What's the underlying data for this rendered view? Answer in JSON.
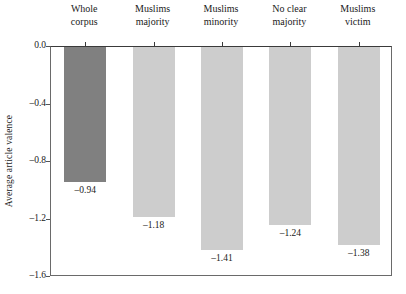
{
  "chart_data": {
    "type": "bar",
    "title": "",
    "subtitle": "",
    "xlabel": "",
    "ylabel": "Average article valence",
    "orientation": "vertical-negative",
    "categories": [
      "Whole corpus",
      "Muslims majority",
      "Muslims minority",
      "No clear majority",
      "Muslims victim"
    ],
    "category_lines": [
      [
        "Whole",
        "corpus"
      ],
      [
        "Muslims",
        "majority"
      ],
      [
        "Muslims",
        "minority"
      ],
      [
        "No clear",
        "majority"
      ],
      [
        "Muslims",
        "victim"
      ]
    ],
    "values": [
      -0.94,
      -1.18,
      -1.41,
      -1.24,
      -1.38
    ],
    "value_labels": [
      "–0.94",
      "–1.18",
      "–1.41",
      "–1.24",
      "–1.38"
    ],
    "ylim": [
      -1.6,
      0.0
    ],
    "yticks": [
      0.0,
      -0.4,
      -0.8,
      -1.2,
      -1.6
    ],
    "ytick_labels": [
      "0.0",
      "–0.4",
      "–0.8",
      "–1.2",
      "–1.6"
    ],
    "grid": false,
    "legend": "none",
    "bar_colors": [
      "#808080",
      "#cdcdcd",
      "#cdcdcd",
      "#cdcdcd",
      "#cdcdcd"
    ],
    "axis_color": "#6a6a6a",
    "text_color": "#1a1a1a"
  }
}
